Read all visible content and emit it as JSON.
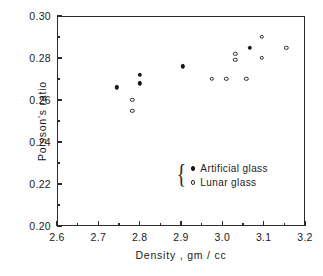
{
  "chart_data": {
    "type": "scatter",
    "title": "",
    "xlabel": "Density ,  gm / cc",
    "ylabel": "Poisson's  ratio",
    "xlim": [
      2.6,
      3.2
    ],
    "ylim": [
      0.2,
      0.3
    ],
    "xticks": [
      "2.6",
      "2.7",
      "2.8",
      "2.9",
      "3.0",
      "3.1",
      "3.2"
    ],
    "xtick_values": [
      2.6,
      2.7,
      2.8,
      2.9,
      3.0,
      3.1,
      3.2
    ],
    "xminor_values": [
      2.65,
      2.75,
      2.85,
      2.95,
      3.05,
      3.15
    ],
    "yticks": [
      "0.20",
      "0.22",
      "0.24",
      "0.26",
      "0.28",
      "0.30"
    ],
    "ytick_values": [
      0.2,
      0.22,
      0.24,
      0.26,
      0.28,
      0.3
    ],
    "yminor_values": [
      0.21,
      0.23,
      0.25,
      0.27,
      0.29
    ],
    "grid": false,
    "legend_position": "inside-lower-right",
    "series": [
      {
        "name": "Artificial glass",
        "marker": "filled-circle",
        "color": "#161616",
        "points": [
          {
            "x": 2.745,
            "y": 0.266
          },
          {
            "x": 2.8,
            "y": 0.272
          },
          {
            "x": 2.8,
            "y": 0.268
          },
          {
            "x": 2.905,
            "y": 0.276
          },
          {
            "x": 3.067,
            "y": 0.285
          }
        ]
      },
      {
        "name": "Lunar glass",
        "marker": "open-circle",
        "color": "#2b2b2b",
        "points": [
          {
            "x": 2.782,
            "y": 0.26
          },
          {
            "x": 2.782,
            "y": 0.255
          },
          {
            "x": 2.975,
            "y": 0.27
          },
          {
            "x": 3.01,
            "y": 0.27
          },
          {
            "x": 3.058,
            "y": 0.27
          },
          {
            "x": 3.031,
            "y": 0.282
          },
          {
            "x": 3.031,
            "y": 0.279
          },
          {
            "x": 3.096,
            "y": 0.29
          },
          {
            "x": 3.096,
            "y": 0.28
          },
          {
            "x": 3.155,
            "y": 0.285
          }
        ]
      }
    ]
  },
  "legend": {
    "brace": "{",
    "entries": [
      {
        "label": "Artificial glass",
        "marker": "filled-circle"
      },
      {
        "label": "Lunar glass",
        "marker": "open-circle"
      }
    ]
  }
}
